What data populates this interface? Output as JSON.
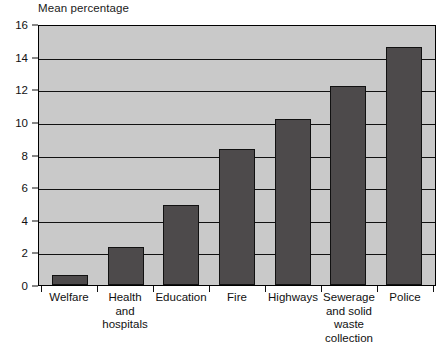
{
  "chart_data": {
    "type": "bar",
    "title": "",
    "ylabel": "Mean percentage",
    "xlabel": "",
    "categories": [
      "Welfare",
      "Health and hospitals",
      "Education",
      "Fire",
      "Highways",
      "Sewerage and solid waste collection",
      "Police"
    ],
    "values": [
      0.6,
      2.3,
      4.9,
      8.35,
      10.2,
      12.2,
      14.6
    ],
    "ylim": [
      0,
      16
    ],
    "ytick_labels": [
      "0",
      "2",
      "4",
      "6",
      "8",
      "10",
      "12",
      "14",
      "16"
    ],
    "ytick_values": [
      0,
      2,
      4,
      6,
      8,
      10,
      12,
      14,
      16
    ],
    "grid": true,
    "legend": false,
    "colors": {
      "bar_fill": "#4d4a4b",
      "bar_border": "#111111",
      "plot_background": "#c9c9c9",
      "axis": "#111111",
      "page_background": "#ffffff"
    }
  },
  "axis_title": "Mean percentage",
  "x_label_lines": [
    [
      "Welfare"
    ],
    [
      "Health and",
      "hospitals"
    ],
    [
      "Education"
    ],
    [
      "Fire"
    ],
    [
      "Highways"
    ],
    [
      "Sewerage",
      "and solid",
      "waste",
      "collection"
    ],
    [
      "Police"
    ]
  ]
}
